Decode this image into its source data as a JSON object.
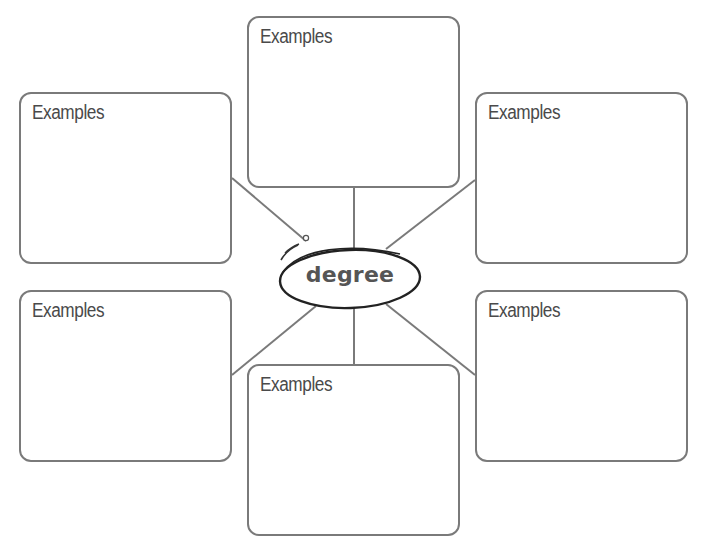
{
  "diagram": {
    "type": "word-web",
    "center": {
      "label": "degree"
    },
    "colors": {
      "box_border": "#7a7a7a",
      "connector": "#7a7a7a",
      "label_text": "#4a4a4a",
      "center_text": "#555555",
      "ellipse_stroke": "#222222"
    },
    "boxes": [
      {
        "position": "top-center",
        "label": "Examples"
      },
      {
        "position": "top-left",
        "label": "Examples"
      },
      {
        "position": "top-right",
        "label": "Examples"
      },
      {
        "position": "bottom-left",
        "label": "Examples"
      },
      {
        "position": "bottom-right",
        "label": "Examples"
      },
      {
        "position": "bottom-center",
        "label": "Examples"
      }
    ]
  }
}
